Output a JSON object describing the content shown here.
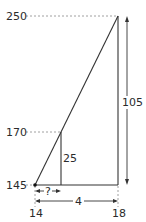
{
  "diagram": {
    "type": "similar-triangles-interpolation",
    "y_labels": {
      "top": "250",
      "middle": "170",
      "bottom": "145"
    },
    "x_labels": {
      "left": "14",
      "right": "18"
    },
    "dimensions": {
      "total_height": "105",
      "small_height": "25",
      "unknown_width": "?",
      "total_width": "4"
    },
    "colors": {
      "line": "#333333",
      "dash": "#888888",
      "text": "#2b2b2b"
    }
  }
}
